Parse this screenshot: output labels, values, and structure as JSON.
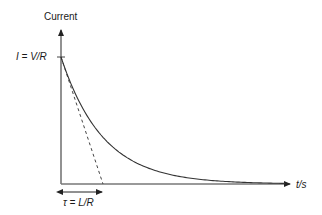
{
  "chart_data": {
    "type": "line",
    "title": "",
    "ylabel": "Current",
    "xlabel": "t/s",
    "y_tick_label": "I = V/R",
    "tau_label": "τ = L/R",
    "series": [
      {
        "name": "current decay",
        "style": "solid",
        "function": "I = (V/R)·e^(-t/τ)",
        "x_tau": [
          0,
          0.5,
          1,
          1.5,
          2,
          3,
          4,
          5
        ],
        "values_fraction_of_V_over_R": [
          1.0,
          0.607,
          0.368,
          0.223,
          0.135,
          0.05,
          0.018,
          0.007
        ]
      },
      {
        "name": "initial tangent",
        "style": "dashed",
        "from": [
          0,
          1.0
        ],
        "to": [
          1,
          0
        ]
      }
    ],
    "annotations": [
      "I = V/R marked on y-axis",
      "τ = L/R double-arrow under x-axis from 0 to τ"
    ],
    "grid": false
  },
  "labels": {
    "y_axis": "Current",
    "y_tick": "I = V/R",
    "x_axis": "t/s",
    "tau": "τ = L/R"
  },
  "colors": {
    "line": "#333333",
    "axis": "#777777"
  }
}
